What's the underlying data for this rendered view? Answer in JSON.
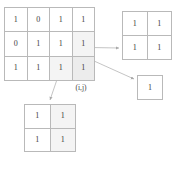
{
  "diagram": {
    "label_ij": "(i,j)",
    "colors": {
      "grid_line": "#b9b9b9",
      "text": "#3c3c3c",
      "shade_strong": "#ececec",
      "shade_light": "#f4f4f4",
      "arrow": "#b0b0b0",
      "background": "#ffffff"
    }
  },
  "main_grid": {
    "name": "main-matrix",
    "rows": 3,
    "cols": 4,
    "cells": [
      [
        {
          "value": "1",
          "shade": "none"
        },
        {
          "value": "0",
          "shade": "none"
        },
        {
          "value": "1",
          "shade": "none"
        },
        {
          "value": "1",
          "shade": "none"
        }
      ],
      [
        {
          "value": "0",
          "shade": "none"
        },
        {
          "value": "1",
          "shade": "none"
        },
        {
          "value": "1",
          "shade": "none"
        },
        {
          "value": "1",
          "shade": "light"
        }
      ],
      [
        {
          "value": "1",
          "shade": "none"
        },
        {
          "value": "1",
          "shade": "none"
        },
        {
          "value": "1",
          "shade": "light"
        },
        {
          "value": "1",
          "shade": "strong"
        }
      ]
    ]
  },
  "top_right_grid": {
    "name": "submatrix-2x2-right",
    "rows": 2,
    "cols": 2,
    "cells": [
      [
        {
          "value": "1",
          "shade": "none"
        },
        {
          "value": "1",
          "shade": "none"
        }
      ],
      [
        {
          "value": "1",
          "shade": "none"
        },
        {
          "value": "1",
          "shade": "none"
        }
      ]
    ]
  },
  "single_grid": {
    "name": "submatrix-1x1",
    "rows": 1,
    "cols": 1,
    "cells": [
      [
        {
          "value": "1",
          "shade": "none"
        }
      ]
    ]
  },
  "bottom_grid": {
    "name": "submatrix-2x2-bottom",
    "rows": 2,
    "cols": 2,
    "cells": [
      [
        {
          "value": "1",
          "shade": "none"
        },
        {
          "value": "1",
          "shade": "light"
        }
      ],
      [
        {
          "value": "1",
          "shade": "none"
        },
        {
          "value": "1",
          "shade": "light"
        }
      ]
    ]
  },
  "arrows": [
    {
      "name": "arrow-to-right-2x2",
      "from": [
        63,
        47
      ],
      "to": [
        120,
        48
      ]
    },
    {
      "name": "arrow-to-single-cell",
      "from": [
        63,
        47
      ],
      "to": [
        135,
        79
      ]
    },
    {
      "name": "arrow-to-bottom-2x2",
      "from": [
        63,
        62
      ],
      "to": [
        50,
        101
      ]
    }
  ]
}
